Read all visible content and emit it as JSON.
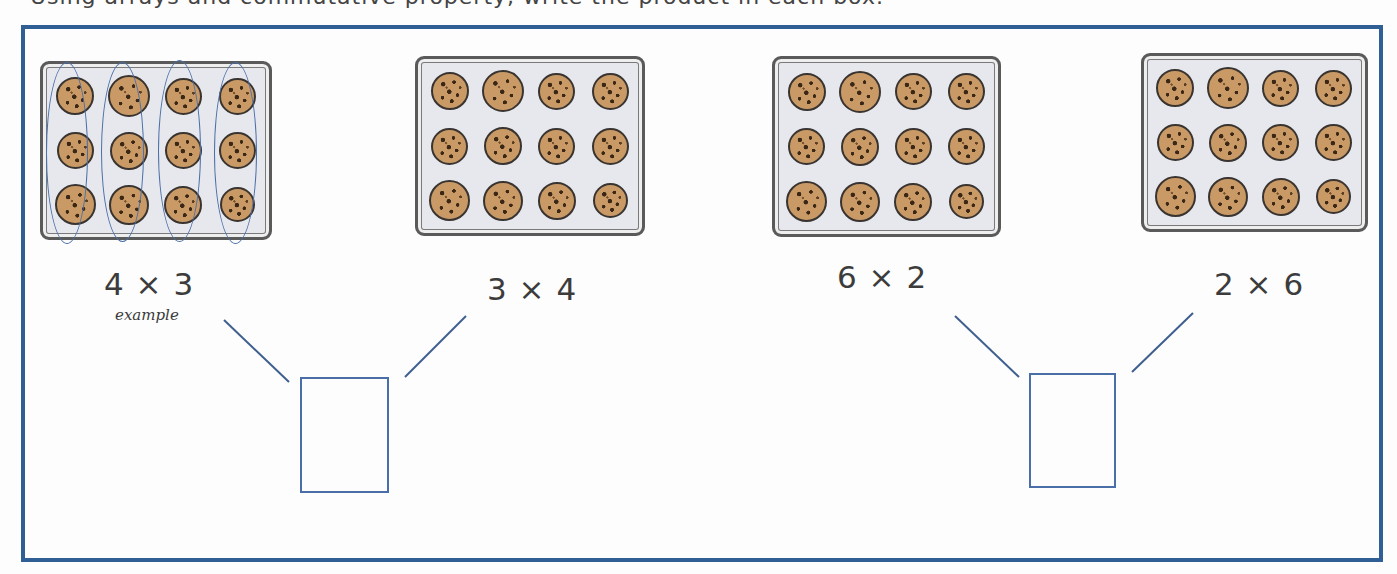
{
  "worksheet": {
    "top_text_cutoff": "Using arrays and commutative property, write the product in each box.",
    "frame_color": "#2f5f94",
    "accent_color": "#4a6fa8",
    "cookie_color": "#c99a66",
    "tray_color": "#e6e8ee"
  },
  "arrays": [
    {
      "id": "tray-1",
      "expression": "4 × 3",
      "note": "example",
      "rows": 3,
      "cols": 4,
      "grouped_columns": true
    },
    {
      "id": "tray-2",
      "expression": "3 × 4",
      "rows": 3,
      "cols": 4,
      "grouped_columns": false
    },
    {
      "id": "tray-3",
      "expression": "6 × 2",
      "rows": 3,
      "cols": 4,
      "grouped_columns": false
    },
    {
      "id": "tray-4",
      "expression": "2 × 6",
      "rows": 3,
      "cols": 4,
      "grouped_columns": false
    }
  ],
  "answer_boxes": [
    {
      "id": "answer-1",
      "pair": [
        "4 × 3",
        "3 × 4"
      ],
      "value": ""
    },
    {
      "id": "answer-2",
      "pair": [
        "6 × 2",
        "2 × 6"
      ],
      "value": ""
    }
  ]
}
